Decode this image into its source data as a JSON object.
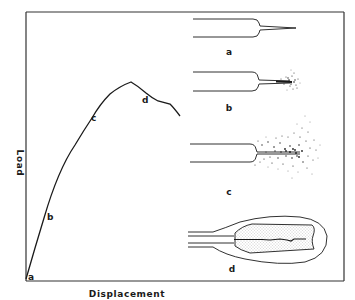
{
  "figure": {
    "type": "load-displacement diagram with crack-tip damage stages",
    "x_axis_label": "Displacement",
    "y_axis_label": "Load",
    "curve_points": [
      {
        "label": "a",
        "x": 26,
        "y": 279
      },
      {
        "label": "b",
        "x": 44,
        "y": 218
      },
      {
        "label": "c",
        "x": 92,
        "y": 118
      },
      {
        "label": "d",
        "x": 147,
        "y": 99
      }
    ],
    "stages": [
      {
        "label": "a",
        "description": "sharp crack, no damage zone"
      },
      {
        "label": "b",
        "description": "small damage zone at crack tip"
      },
      {
        "label": "c",
        "description": "large diffuse damage zone ahead of crack"
      },
      {
        "label": "d",
        "description": "crack growth inside dense damage zone with outer envelope"
      }
    ],
    "colors": {
      "ink": "#1a1a1a",
      "background": "#ffffff",
      "frame": "#333333",
      "stipple": "#bbbbbb"
    }
  }
}
